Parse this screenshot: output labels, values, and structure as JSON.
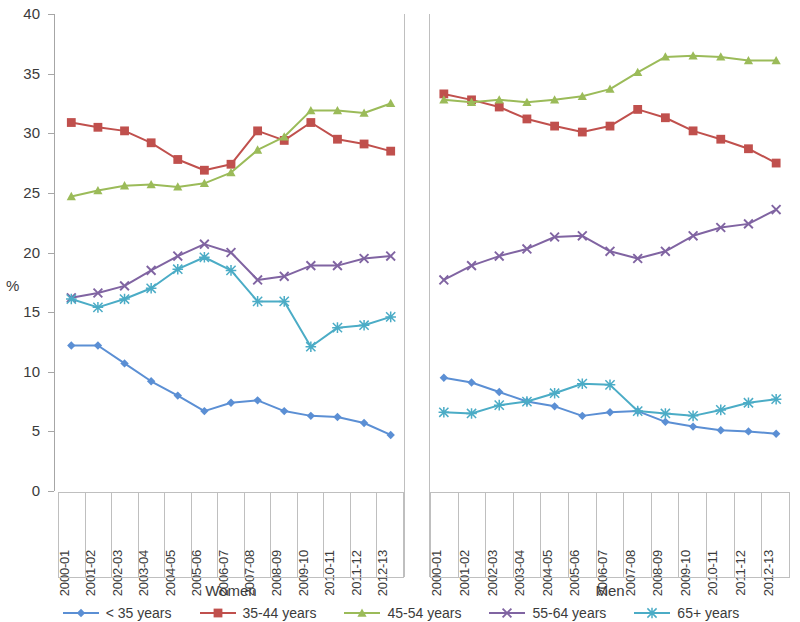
{
  "chart_data": {
    "type": "line",
    "title": "",
    "subtitle": "",
    "xlabel": "",
    "ylabel": "%",
    "ylim": [
      0,
      40
    ],
    "ytick_step": 5,
    "yticks": [
      "0",
      "5",
      "10",
      "15",
      "20",
      "25",
      "30",
      "35",
      "40"
    ],
    "grid": false,
    "legend_position": "bottom",
    "groups": [
      "Women",
      "Men"
    ],
    "categories": [
      "2000-01",
      "2001-02",
      "2002-03",
      "2003-04",
      "2004-05",
      "2005-06",
      "2006-07",
      "2007-08",
      "2008-09",
      "2009-10",
      "2010-11",
      "2011-12",
      "2012-13"
    ],
    "panels": [
      {
        "name": "Women",
        "series": [
          {
            "name": "< 35 years",
            "color": "#5B8FD4",
            "marker": "diamond",
            "values": [
              12.2,
              12.2,
              10.7,
              9.2,
              8.0,
              6.7,
              7.4,
              7.6,
              6.7,
              6.3,
              6.2,
              5.7,
              4.7
            ]
          },
          {
            "name": "35-44 years",
            "color": "#C0504D",
            "marker": "square",
            "values": [
              30.9,
              30.5,
              30.2,
              29.2,
              27.8,
              26.9,
              27.4,
              30.2,
              29.4,
              30.9,
              29.5,
              29.1,
              28.5
            ]
          },
          {
            "name": "45-54 years",
            "color": "#9BBB59",
            "marker": "triangle",
            "values": [
              24.7,
              25.2,
              25.6,
              25.7,
              25.5,
              25.8,
              26.7,
              28.6,
              29.7,
              31.9,
              31.9,
              31.7,
              32.5
            ]
          },
          {
            "name": "55-64 years",
            "color": "#8064A2",
            "marker": "cross",
            "values": [
              16.2,
              16.6,
              17.2,
              18.5,
              19.7,
              20.7,
              20.0,
              17.7,
              18.0,
              18.9,
              18.9,
              19.5,
              19.7
            ]
          },
          {
            "name": "65+ years",
            "color": "#4BACC6",
            "marker": "star",
            "values": [
              16.1,
              15.4,
              16.1,
              17.0,
              18.6,
              19.6,
              18.5,
              15.9,
              15.9,
              12.1,
              13.7,
              13.9,
              14.6
            ]
          }
        ]
      },
      {
        "name": "Men",
        "series": [
          {
            "name": "< 35 years",
            "color": "#5B8FD4",
            "marker": "diamond",
            "values": [
              9.5,
              9.1,
              8.3,
              7.5,
              7.1,
              6.3,
              6.6,
              6.7,
              5.8,
              5.4,
              5.1,
              5.0,
              4.8
            ]
          },
          {
            "name": "35-44 years",
            "color": "#C0504D",
            "marker": "square",
            "values": [
              33.3,
              32.8,
              32.2,
              31.2,
              30.6,
              30.1,
              30.6,
              32.0,
              31.3,
              30.2,
              29.5,
              28.7,
              27.5
            ]
          },
          {
            "name": "45-54 years",
            "color": "#9BBB59",
            "marker": "triangle",
            "values": [
              32.8,
              32.6,
              32.8,
              32.6,
              32.8,
              33.1,
              33.7,
              35.1,
              36.4,
              36.5,
              36.4,
              36.1,
              36.1
            ]
          },
          {
            "name": "55-64 years",
            "color": "#8064A2",
            "marker": "cross",
            "values": [
              17.7,
              18.9,
              19.7,
              20.3,
              21.3,
              21.4,
              20.1,
              19.5,
              20.1,
              21.4,
              22.1,
              22.4,
              23.6
            ]
          },
          {
            "name": "65+ years",
            "color": "#4BACC6",
            "marker": "star",
            "values": [
              6.6,
              6.5,
              7.2,
              7.5,
              8.2,
              9.0,
              8.9,
              6.7,
              6.5,
              6.3,
              6.8,
              7.4,
              7.7
            ]
          }
        ]
      }
    ],
    "legend": [
      {
        "label": "< 35 years",
        "color": "#5B8FD4",
        "marker": "diamond"
      },
      {
        "label": "35-44 years",
        "color": "#C0504D",
        "marker": "square"
      },
      {
        "label": "45-54 years",
        "color": "#9BBB59",
        "marker": "triangle"
      },
      {
        "label": "55-64 years",
        "color": "#8064A2",
        "marker": "cross"
      },
      {
        "label": "65+ years",
        "color": "#4BACC6",
        "marker": "star"
      }
    ]
  }
}
